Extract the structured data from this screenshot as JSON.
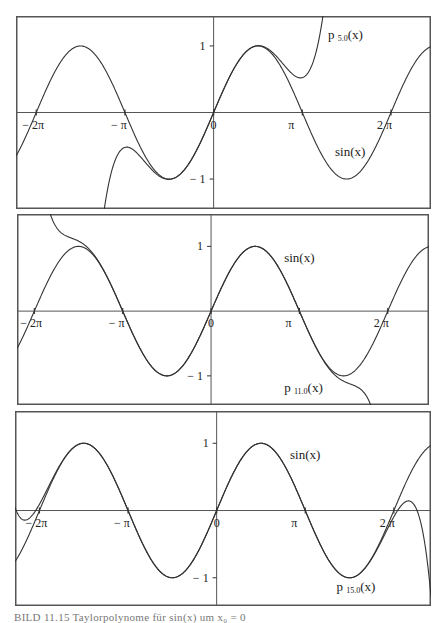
{
  "figure": {
    "caption": "BILD 11.15 Taylorpolynome für sin(x) um x₀ = 0"
  },
  "chart_data": [
    {
      "type": "line",
      "title": "",
      "xlabel": "",
      "ylabel": "",
      "xlim": [
        -7.0,
        7.7
      ],
      "ylim": [
        -1.45,
        1.45
      ],
      "grid": false,
      "x_ticks": [
        {
          "value": -6.2832,
          "label": "− 2π"
        },
        {
          "value": -3.1416,
          "label": "− π"
        },
        {
          "value": 0,
          "label": "0"
        },
        {
          "value": 3.1416,
          "label": "π"
        },
        {
          "value": 6.2832,
          "label": "2 π"
        }
      ],
      "y_ticks": [
        {
          "value": 1,
          "label": "1"
        },
        {
          "value": -1,
          "label": "− 1"
        }
      ],
      "series": [
        {
          "name": "sin(x)",
          "func": "sin",
          "label": "sin(x)",
          "label_pos": [
            4.3,
            -0.65
          ]
        },
        {
          "name": "p5.0(x)",
          "func": "taylor",
          "order": 5,
          "label": "p",
          "sub": "5.0",
          "suffix": "(x)",
          "label_pos": [
            4.05,
            1.1
          ]
        }
      ]
    },
    {
      "type": "line",
      "title": "",
      "xlabel": "",
      "ylabel": "",
      "xlim": [
        -6.9,
        7.75
      ],
      "ylim": [
        -1.45,
        1.5
      ],
      "grid": false,
      "x_ticks": [
        {
          "value": -6.2832,
          "label": "− 2π"
        },
        {
          "value": -3.1416,
          "label": "− π"
        },
        {
          "value": 0,
          "label": "0"
        },
        {
          "value": 3.1416,
          "label": "π"
        },
        {
          "value": 6.2832,
          "label": "2 π"
        }
      ],
      "y_ticks": [
        {
          "value": 1,
          "label": "1"
        },
        {
          "value": -1,
          "label": "− 1"
        }
      ],
      "series": [
        {
          "name": "sin(x)",
          "func": "sin",
          "label": "sin(x)",
          "label_pos": [
            2.6,
            0.76
          ]
        },
        {
          "name": "p11.0(x)",
          "func": "taylor",
          "order": 11,
          "label": "p",
          "sub": "11.0",
          "suffix": "(x)",
          "label_pos": [
            2.6,
            -1.25
          ]
        }
      ]
    },
    {
      "type": "line",
      "title": "",
      "xlabel": "",
      "ylabel": "",
      "xlim": [
        -7.15,
        7.6
      ],
      "ylim": [
        -1.42,
        1.48
      ],
      "grid": false,
      "x_ticks": [
        {
          "value": -6.2832,
          "label": "− 2π"
        },
        {
          "value": -3.1416,
          "label": "− π"
        },
        {
          "value": 0,
          "label": "0"
        },
        {
          "value": 3.1416,
          "label": "π"
        },
        {
          "value": 6.2832,
          "label": "2 π"
        }
      ],
      "y_ticks": [
        {
          "value": 1,
          "label": "1"
        },
        {
          "value": -1,
          "label": "− 1"
        }
      ],
      "series": [
        {
          "name": "sin(x)",
          "func": "sin",
          "label": "sin(x)",
          "label_pos": [
            2.6,
            0.76
          ]
        },
        {
          "name": "p15.0(x)",
          "func": "taylor",
          "order": 15,
          "label": "p",
          "sub": "15.0",
          "suffix": "(x)",
          "label_pos": [
            4.25,
            -1.2
          ]
        }
      ]
    }
  ]
}
